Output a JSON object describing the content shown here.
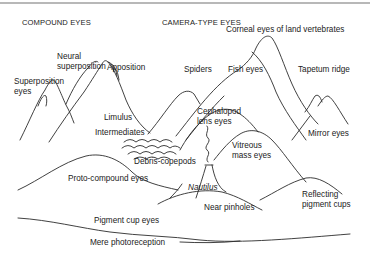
{
  "headers": {
    "compound": "COMPOUND EYES",
    "camera": "CAMERA-TYPE EYES"
  },
  "labels": {
    "superposition_1": "Superposition",
    "superposition_2": "eyes",
    "neural_1": "Neural",
    "neural_2": "superposition",
    "apposition": "Apposition",
    "limulus": "Limulus",
    "intermediates": "Intermediates",
    "debris": "Debris-copepods",
    "proto": "Proto-compound eyes",
    "pigment_cup": "Pigment cup eyes",
    "mere": "Mere photoreception",
    "corneal": "Corneal eyes of land vertebrates",
    "spiders": "Spiders",
    "fish": "Fish eyes",
    "tapetum": "Tapetum ridge",
    "cephalopod_1": "Cephalopod",
    "cephalopod_2": "lens eyes",
    "mirror": "Mirror eyes",
    "vitreous_1": "Vitreous",
    "vitreous_2": "mass eyes",
    "nautilus": "Nautilus",
    "near_pinholes": "Near pinholes",
    "reflecting_1": "Reflecting",
    "reflecting_2": "pigment cups"
  },
  "colors": {
    "line": "#2b2b2b",
    "text": "#222222",
    "frame": "#b8b8b8"
  }
}
